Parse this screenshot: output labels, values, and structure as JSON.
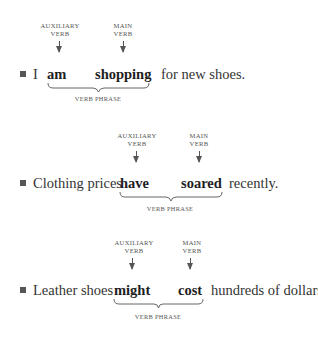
{
  "labels": {
    "auxiliary_line1": "AUXILIARY",
    "auxiliary_line2": "VERB",
    "main_line1": "MAIN",
    "main_line2": "VERB",
    "verb_phrase": "VERB PHRASE"
  },
  "examples": [
    {
      "subject": "I",
      "auxiliary": "am",
      "main": "shopping",
      "rest": "for new shoes."
    },
    {
      "subject": "Clothing prices",
      "auxiliary": "have",
      "main": "soared",
      "rest": "recently."
    },
    {
      "subject": "Leather shoes",
      "auxiliary": "might",
      "main": "cost",
      "rest": "hundreds of dollars."
    }
  ]
}
